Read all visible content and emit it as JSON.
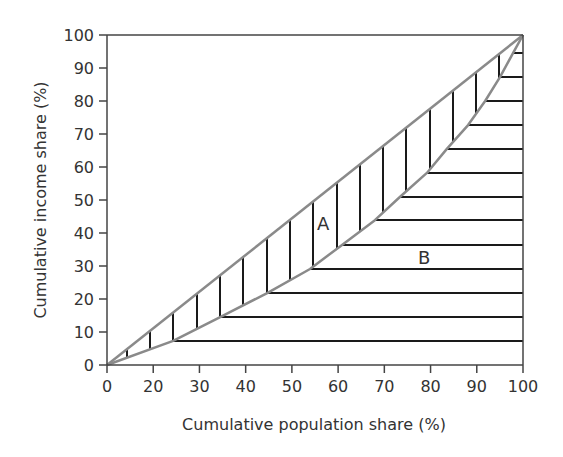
{
  "chart_data": {
    "type": "line",
    "title": "",
    "xlabel": "Cumulative population share (%)",
    "ylabel": "Cumulative income share (%)",
    "x_tick_labels": [
      "0",
      "20",
      "30",
      "40",
      "50",
      "60",
      "70",
      "80",
      "90",
      "100"
    ],
    "y_tick_labels": [
      "0",
      "10",
      "20",
      "30",
      "40",
      "50",
      "60",
      "70",
      "80",
      "90",
      "100"
    ],
    "xlim": [
      0,
      100
    ],
    "ylim": [
      0,
      100
    ],
    "grid": false,
    "legend": null,
    "series": [
      {
        "name": "Line of equality",
        "color": "#8a8a8a",
        "x": [
          0,
          100
        ],
        "y": [
          0,
          100
        ]
      },
      {
        "name": "Lorenz curve",
        "color": "#8a8a8a",
        "x": [
          0,
          15.9,
          27.2,
          38.5,
          48.8,
          56.5,
          64.4,
          70.4,
          76.9,
          81.7,
          86.8,
          90.9,
          94.5,
          97.6,
          100
        ],
        "y": [
          0,
          7.3,
          14.5,
          21.8,
          29.1,
          36.4,
          43.9,
          50.9,
          58.2,
          65.5,
          72.7,
          80.0,
          87.3,
          94.5,
          100
        ]
      }
    ],
    "annotations": [
      {
        "text": "A",
        "x": 52.5,
        "y": 43,
        "meaning": "area between line of equality and Lorenz curve (vertical hatching)"
      },
      {
        "text": "B",
        "x": 77,
        "y": 32,
        "meaning": "area below Lorenz curve (horizontal hatching)"
      }
    ],
    "hatch": {
      "vertical_x_px": [
        127,
        150,
        173,
        197,
        220,
        243,
        267,
        290,
        313,
        337,
        360,
        383,
        406,
        430,
        453,
        476,
        499
      ],
      "horizontal_y_px": [
        341,
        317,
        293,
        269,
        245,
        220,
        197,
        173,
        149,
        125,
        101,
        77,
        53
      ]
    }
  },
  "labels": {
    "region_a": "A",
    "region_b": "B"
  }
}
